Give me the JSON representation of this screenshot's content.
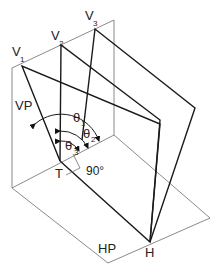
{
  "diagram": {
    "type": "projection-planes",
    "labels": {
      "v1": "V",
      "v1_sub": "1",
      "v2": "V",
      "v2_sub": "2",
      "v3": "V",
      "v3_sub": "3",
      "vp": "VP",
      "hp": "HP",
      "t": "T",
      "h": "H",
      "theta1": "θ",
      "theta1_sub": "1",
      "theta2": "θ",
      "theta2_sub": "2",
      "theta3": "θ",
      "theta3_sub": "3",
      "right_angle": "90°"
    },
    "colors": {
      "plane_outline": "#8a8a8a",
      "plane_edges": "#1a1a1a",
      "text": "#222222"
    }
  }
}
